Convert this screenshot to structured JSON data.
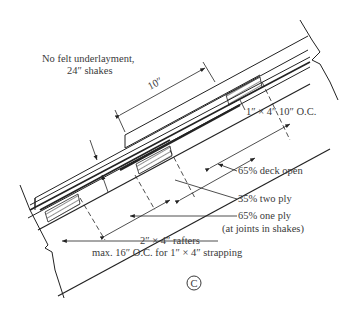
{
  "figure_label": "C",
  "annotations": {
    "note_line1": "No felt underlayment,",
    "note_line2": "24″ shakes",
    "exposure": "10″",
    "strapping": "1″ × 4″  10″ O.C.",
    "deck_open": "65% deck open",
    "two_ply": "35% two ply",
    "one_ply": "65% one ply",
    "one_ply_note": "(at joints in shakes)",
    "rafters_line1": "2″ × 4″ rafters",
    "rafters_line2": "max. 16″ O.C. for 1″ × 4″ strapping"
  }
}
